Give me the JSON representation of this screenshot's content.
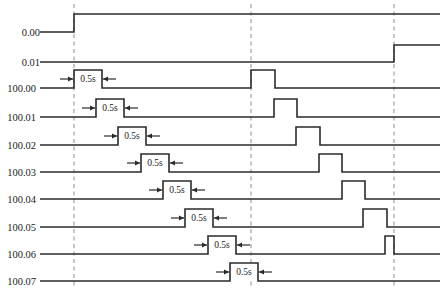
{
  "figure": {
    "type": "timing-diagram",
    "title": "",
    "width": 444,
    "height": 292,
    "background_color": "#ffffff",
    "signal_color": "#2b2b2b",
    "marker_color": "#9a9a9a",
    "duration_label": "0.5s"
  },
  "markers": [
    {
      "name": "marker-1",
      "x": 74
    },
    {
      "name": "marker-2",
      "x": 251
    },
    {
      "name": "marker-3",
      "x": 394
    }
  ],
  "chart_data": {
    "type": "line",
    "title": "",
    "xlabel": "",
    "ylabel": "",
    "grid": false,
    "legend": "none",
    "axis_note": "time axis left-to-right; each row is one boolean signal, low=baseline high=raised",
    "time_markers": [
      74,
      251,
      394
    ],
    "rows": [
      {
        "label": "0.00",
        "baseline_y": 32,
        "label_x": 8,
        "lead_from": 40,
        "lead_to": 74,
        "high_level_y": 14,
        "transitions": [
          {
            "x": 74,
            "edge": "rise"
          }
        ],
        "pulses": [],
        "duration_markers": []
      },
      {
        "label": "0.01",
        "baseline_y": 62,
        "label_x": 8,
        "lead_from": 40,
        "lead_to": 74,
        "high_level_y": 45,
        "transitions": [
          {
            "x": 394,
            "edge": "rise"
          }
        ],
        "pulses": [],
        "duration_markers": []
      },
      {
        "label": "100.00",
        "baseline_y": 88,
        "label_x": 4,
        "lead_from": 40,
        "lead_to": 74,
        "high_level_y": 70,
        "transitions": [],
        "pulses": [
          {
            "start": 74,
            "end": 102
          },
          {
            "start": 251,
            "end": 275
          }
        ],
        "duration_markers": [
          {
            "x1": 60,
            "x2": 116,
            "box_x1": 74,
            "box_x2": 102,
            "y": 79,
            "text": "0.5s"
          }
        ]
      },
      {
        "label": "100.01",
        "baseline_y": 117,
        "label_x": 4,
        "lead_from": 40,
        "lead_to": 96,
        "high_level_y": 99,
        "transitions": [],
        "pulses": [
          {
            "start": 96,
            "end": 124
          },
          {
            "start": 274,
            "end": 297
          }
        ],
        "duration_markers": [
          {
            "x1": 82,
            "x2": 138,
            "box_x1": 96,
            "box_x2": 124,
            "y": 108,
            "text": "0.5s"
          }
        ]
      },
      {
        "label": "100.02",
        "baseline_y": 145,
        "label_x": 4,
        "lead_from": 40,
        "lead_to": 118,
        "high_level_y": 127,
        "transitions": [],
        "pulses": [
          {
            "start": 118,
            "end": 146
          },
          {
            "start": 296,
            "end": 320
          }
        ],
        "duration_markers": [
          {
            "x1": 104,
            "x2": 160,
            "box_x1": 118,
            "box_x2": 146,
            "y": 136,
            "text": "0.5s"
          }
        ]
      },
      {
        "label": "100.03",
        "baseline_y": 172,
        "label_x": 4,
        "lead_from": 40,
        "lead_to": 141,
        "high_level_y": 154,
        "transitions": [],
        "pulses": [
          {
            "start": 141,
            "end": 169
          },
          {
            "start": 319,
            "end": 342
          }
        ],
        "duration_markers": [
          {
            "x1": 127,
            "x2": 183,
            "box_x1": 141,
            "box_x2": 169,
            "y": 163,
            "text": "0.5s"
          }
        ]
      },
      {
        "label": "100.04",
        "baseline_y": 199,
        "label_x": 4,
        "lead_from": 40,
        "lead_to": 163,
        "high_level_y": 181,
        "transitions": [],
        "pulses": [
          {
            "start": 163,
            "end": 191
          },
          {
            "start": 342,
            "end": 365
          }
        ],
        "duration_markers": [
          {
            "x1": 149,
            "x2": 205,
            "box_x1": 163,
            "box_x2": 191,
            "y": 190,
            "text": "0.5s"
          }
        ]
      },
      {
        "label": "100.05",
        "baseline_y": 227,
        "label_x": 4,
        "lead_from": 40,
        "lead_to": 185,
        "high_level_y": 209,
        "transitions": [],
        "pulses": [
          {
            "start": 185,
            "end": 213
          },
          {
            "start": 363,
            "end": 387
          }
        ],
        "duration_markers": [
          {
            "x1": 171,
            "x2": 227,
            "box_x1": 185,
            "box_x2": 213,
            "y": 218,
            "text": "0.5s"
          }
        ]
      },
      {
        "label": "100.06",
        "baseline_y": 254,
        "label_x": 4,
        "lead_from": 40,
        "lead_to": 208,
        "high_level_y": 236,
        "transitions": [],
        "pulses": [
          {
            "start": 208,
            "end": 236
          },
          {
            "start": 385,
            "end": 394
          }
        ],
        "duration_markers": [
          {
            "x1": 194,
            "x2": 250,
            "box_x1": 208,
            "box_x2": 236,
            "y": 245,
            "text": "0.5s"
          }
        ]
      },
      {
        "label": "100.07",
        "baseline_y": 281,
        "label_x": 4,
        "lead_from": 40,
        "lead_to": 230,
        "high_level_y": 263,
        "transitions": [],
        "pulses": [
          {
            "start": 230,
            "end": 258
          }
        ],
        "duration_markers": [
          {
            "x1": 216,
            "x2": 272,
            "box_x1": 230,
            "box_x2": 258,
            "y": 272,
            "text": "0.5s"
          }
        ]
      }
    ]
  }
}
